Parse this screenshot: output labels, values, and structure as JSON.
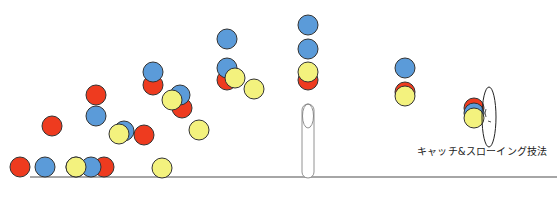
{
  "diagram": {
    "caption": "キャッチ&スローイング技法",
    "colors": {
      "red": "#ee3b1f",
      "blue": "#5b9bd9",
      "yellow": "#f3f27e",
      "outline": "#333333",
      "ground": "#888888"
    },
    "ground": {
      "x1": 30,
      "x2": 557,
      "y": 177
    },
    "balls_radius": 10,
    "balls": [
      {
        "x": 20,
        "y": 167,
        "c": "red"
      },
      {
        "x": 45,
        "y": 167,
        "c": "blue"
      },
      {
        "x": 76,
        "y": 167,
        "c": "yellow"
      },
      {
        "x": 104,
        "y": 167,
        "c": "red"
      },
      {
        "x": 91,
        "y": 167,
        "c": "blue"
      },
      {
        "x": 76,
        "y": 167,
        "c": "yellow"
      },
      {
        "x": 162,
        "y": 168,
        "c": "yellow"
      },
      {
        "x": 52,
        "y": 126,
        "c": "red"
      },
      {
        "x": 96,
        "y": 116,
        "c": "blue"
      },
      {
        "x": 96,
        "y": 95,
        "c": "red"
      },
      {
        "x": 124,
        "y": 131,
        "c": "blue"
      },
      {
        "x": 119,
        "y": 134,
        "c": "yellow"
      },
      {
        "x": 144,
        "y": 135,
        "c": "red"
      },
      {
        "x": 153,
        "y": 85,
        "c": "red"
      },
      {
        "x": 153,
        "y": 72,
        "c": "blue"
      },
      {
        "x": 182,
        "y": 108,
        "c": "red"
      },
      {
        "x": 180,
        "y": 95,
        "c": "blue"
      },
      {
        "x": 172,
        "y": 100,
        "c": "yellow"
      },
      {
        "x": 199,
        "y": 130,
        "c": "yellow"
      },
      {
        "x": 227,
        "y": 80,
        "c": "red"
      },
      {
        "x": 227,
        "y": 68,
        "c": "blue"
      },
      {
        "x": 227,
        "y": 39,
        "c": "blue"
      },
      {
        "x": 235,
        "y": 78,
        "c": "yellow"
      },
      {
        "x": 254,
        "y": 89,
        "c": "yellow"
      },
      {
        "x": 308,
        "y": 80,
        "c": "red"
      },
      {
        "x": 308,
        "y": 72,
        "c": "yellow"
      },
      {
        "x": 308,
        "y": 49,
        "c": "blue"
      },
      {
        "x": 308,
        "y": 25,
        "c": "blue"
      },
      {
        "x": 405,
        "y": 68,
        "c": "blue"
      },
      {
        "x": 405,
        "y": 92,
        "c": "red"
      },
      {
        "x": 405,
        "y": 96,
        "c": "yellow"
      },
      {
        "x": 474,
        "y": 108,
        "c": "red"
      },
      {
        "x": 474,
        "y": 113,
        "c": "blue"
      },
      {
        "x": 474,
        "y": 118,
        "c": "yellow"
      }
    ],
    "pins": [
      {
        "x": 308,
        "top": 104,
        "bottom": 178,
        "w": 12,
        "capH": 24
      }
    ],
    "catcher": {
      "cx": 489,
      "cy": 117,
      "rx": 7,
      "ry": 30
    }
  }
}
